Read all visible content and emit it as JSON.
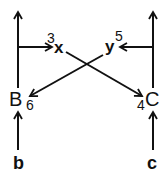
{
  "diagram": {
    "nodes": {
      "B": "B",
      "C": "C",
      "x": "x",
      "y": "y",
      "b": "b",
      "c": "c"
    },
    "labels": {
      "x_label": "3",
      "y_label": "5",
      "C_label": "4",
      "B_label": "6"
    },
    "edges": [
      {
        "from": "b",
        "to": "B"
      },
      {
        "from": "c",
        "to": "C"
      },
      {
        "from": "B",
        "to": "top-left-out"
      },
      {
        "from": "C",
        "to": "top-right-out"
      },
      {
        "from": "B-line",
        "to": "x",
        "label": "3"
      },
      {
        "from": "C-line",
        "to": "y",
        "label": "5"
      },
      {
        "from": "x",
        "to": "C",
        "label": "4"
      },
      {
        "from": "y",
        "to": "B",
        "label": "6"
      }
    ],
    "line_color": "#111111"
  }
}
